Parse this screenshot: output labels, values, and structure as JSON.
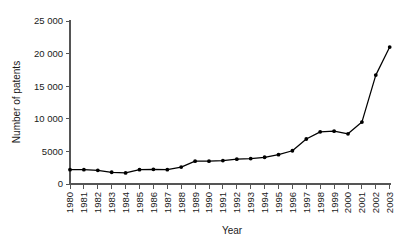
{
  "chart_data": {
    "type": "line",
    "title": "",
    "xlabel": "Year",
    "ylabel": "Number of patents",
    "xlim": [
      1980,
      2003
    ],
    "ylim": [
      0,
      25000
    ],
    "grid": false,
    "legend": null,
    "ytick_labels": [
      "0",
      "5000",
      "10 000",
      "15 000",
      "20 000",
      "25 000"
    ],
    "ytick_values": [
      0,
      5000,
      10000,
      15000,
      20000,
      25000
    ],
    "categories": [
      "1980",
      "1981",
      "1982",
      "1983",
      "1984",
      "1985",
      "1986",
      "1987",
      "1988",
      "1989",
      "1990",
      "1991",
      "1992",
      "1993",
      "1994",
      "1995",
      "1996",
      "1997",
      "1998",
      "1999",
      "2000",
      "2001",
      "2002",
      "2003"
    ],
    "x": [
      1980,
      1981,
      1982,
      1983,
      1984,
      1985,
      1986,
      1987,
      1988,
      1989,
      1990,
      1991,
      1992,
      1993,
      1994,
      1995,
      1996,
      1997,
      1998,
      1999,
      2000,
      2001,
      2002,
      2003
    ],
    "values": [
      2200,
      2200,
      2100,
      1800,
      1700,
      2200,
      2250,
      2200,
      2600,
      3500,
      3500,
      3600,
      3800,
      3900,
      4100,
      4500,
      5100,
      6900,
      8000,
      8100,
      7700,
      9500,
      16700,
      21000
    ],
    "series": [
      {
        "name": "Number of patents",
        "marker": "filled-circle",
        "color": "#000000",
        "values": [
          2200,
          2200,
          2100,
          1800,
          1700,
          2200,
          2250,
          2200,
          2600,
          3500,
          3500,
          3600,
          3800,
          3900,
          4100,
          4500,
          5100,
          6900,
          8000,
          8100,
          7700,
          9500,
          16700,
          21000
        ]
      }
    ]
  }
}
